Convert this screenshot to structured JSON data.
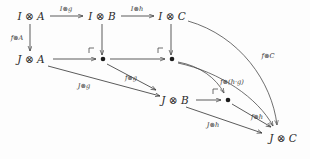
{
  "diagram": {
    "background_color": "#fdfdfd",
    "stroke_color": "#3d3d3d",
    "text_color": "#2b2b2b",
    "nodes": [
      {
        "id": "IA",
        "label": "I ⊗ A",
        "x": 31,
        "y": 19,
        "kind": "object"
      },
      {
        "id": "IB",
        "label": "I ⊗ B",
        "x": 101,
        "y": 19,
        "kind": "object"
      },
      {
        "id": "IC",
        "label": "I ⊗ C",
        "x": 172,
        "y": 19,
        "kind": "object"
      },
      {
        "id": "JA",
        "label": "J ⊗ A",
        "x": 33,
        "y": 61,
        "kind": "object"
      },
      {
        "id": "P1",
        "label": "•",
        "x": 103,
        "y": 61,
        "kind": "dot"
      },
      {
        "id": "P2",
        "label": "•",
        "x": 172,
        "y": 61,
        "kind": "dot"
      },
      {
        "id": "JB",
        "label": "J ⊗ B",
        "x": 176,
        "y": 101,
        "kind": "object"
      },
      {
        "id": "P3",
        "label": "•",
        "x": 228,
        "y": 101,
        "kind": "dot"
      },
      {
        "id": "JC",
        "label": "J ⊗ C",
        "x": 283,
        "y": 138,
        "kind": "object"
      }
    ],
    "edges": [
      {
        "id": "e1",
        "from": "IA",
        "to": "IB",
        "label": "I⊗g",
        "style": "straight"
      },
      {
        "id": "e2",
        "from": "IB",
        "to": "IC",
        "label": "I⊗h",
        "style": "straight"
      },
      {
        "id": "e3",
        "from": "IA",
        "to": "JA",
        "label": "f⊗A",
        "style": "straight"
      },
      {
        "id": "e4",
        "from": "IB",
        "to": "P1",
        "label": "",
        "style": "straight"
      },
      {
        "id": "e5",
        "from": "IC",
        "to": "P2",
        "label": "",
        "style": "straight"
      },
      {
        "id": "e6",
        "from": "JA",
        "to": "P1",
        "label": "",
        "style": "straight"
      },
      {
        "id": "e7",
        "from": "P1",
        "to": "P2",
        "label": "",
        "style": "straight"
      },
      {
        "id": "e8",
        "from": "JA",
        "to": "JB",
        "label": "J⊗g",
        "style": "straight"
      },
      {
        "id": "e9",
        "from": "P1",
        "to": "JB",
        "label": "f⊗g",
        "style": "straight"
      },
      {
        "id": "e10",
        "from": "JB",
        "to": "P3",
        "label": "",
        "style": "straight"
      },
      {
        "id": "e11",
        "from": "P2",
        "to": "P3",
        "label": "",
        "style": "curve"
      },
      {
        "id": "e12",
        "from": "P2",
        "to": "JC",
        "label": "f⊗(h·g)",
        "style": "curve"
      },
      {
        "id": "e13",
        "from": "JB",
        "to": "JC",
        "label": "J⊗h",
        "style": "straight"
      },
      {
        "id": "e14",
        "from": "P3",
        "to": "JC",
        "label": "f⊗h",
        "style": "straight"
      },
      {
        "id": "e15",
        "from": "IC",
        "to": "JC",
        "label": "f⊗C",
        "style": "curve"
      }
    ],
    "labels": {
      "IA": "I ⊗ A",
      "IB": "I ⊗ B",
      "IC": "I ⊗ C",
      "JA": "J ⊗ A",
      "JB": "J ⊗ B",
      "JC": "J ⊗ C",
      "Ig": "I⊗g",
      "Ih": "I⊗h",
      "fA": "f⊗A",
      "Jg": "J⊗g",
      "fg": "f⊗g",
      "fhg": "f⊗(h·g)",
      "Jh": "J⊗h",
      "fh": "f⊗h",
      "fC": "f⊗C"
    },
    "pullback_corners": [
      {
        "id": "c1",
        "x": 89,
        "y": 49
      },
      {
        "id": "c2",
        "x": 158,
        "y": 49
      },
      {
        "id": "c3",
        "x": 213,
        "y": 90
      }
    ]
  }
}
